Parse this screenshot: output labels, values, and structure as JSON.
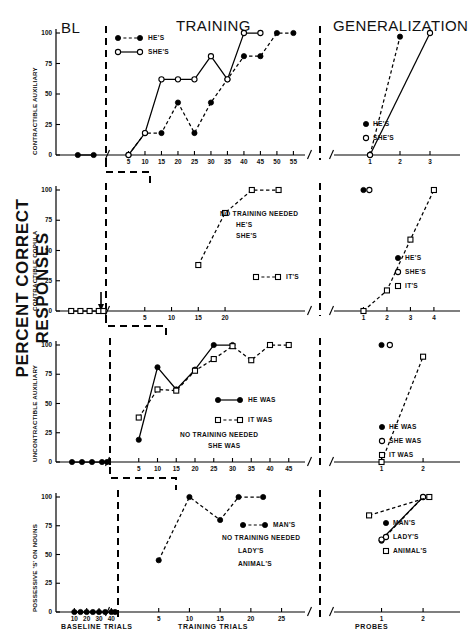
{
  "figure": {
    "y_axis_label": "PERCENT CORRECT RESPONSES",
    "section_titles": {
      "bl": "BL",
      "training": "TRAINING",
      "generalization": "GENERALIZATION"
    },
    "x_axis_names": {
      "baseline": "BASELINE  TRIALS",
      "training": "TRAINING  TRIALS",
      "probes": "PROBES"
    },
    "y_ticks": [
      "0",
      "25",
      "50",
      "75",
      "100"
    ]
  },
  "chart_data": [
    {
      "type": "line",
      "panel": 1,
      "ylabel": "CONTRACTIBLE AUXILIARY",
      "ylim": [
        0,
        100
      ],
      "ticks": {
        "baseline": [
          10,
          20
        ],
        "training": [
          5,
          10,
          15,
          20,
          25,
          30,
          35,
          40,
          45,
          50,
          55
        ],
        "probes": [
          1,
          2,
          3
        ]
      },
      "legend_top": [
        {
          "name": "HE'S",
          "marker": "filled-circle",
          "line": "dashed"
        },
        {
          "name": "SHE'S",
          "marker": "open-circle",
          "line": "solid"
        }
      ],
      "legend_gen": [
        {
          "name": "HE'S",
          "marker": "filled-circle"
        },
        {
          "name": "SHE'S",
          "marker": "open-circle"
        }
      ],
      "series": [
        {
          "name": "HE'S",
          "marker": "filled-circle",
          "line": "dashed",
          "baseline": [
            {
              "x": 10,
              "y": 0
            },
            {
              "x": 20,
              "y": 0
            }
          ],
          "training": [
            {
              "x": 5,
              "y": 0
            },
            {
              "x": 10,
              "y": 18
            },
            {
              "x": 15,
              "y": 18
            },
            {
              "x": 20,
              "y": 43
            },
            {
              "x": 25,
              "y": 18
            },
            {
              "x": 30,
              "y": 43
            },
            {
              "x": 35,
              "y": 62
            },
            {
              "x": 40,
              "y": 81
            },
            {
              "x": 45,
              "y": 81
            },
            {
              "x": 50,
              "y": 100
            },
            {
              "x": 55,
              "y": 100
            }
          ],
          "probes": [
            {
              "x": 1,
              "y": 0
            },
            {
              "x": 2,
              "y": 97
            }
          ]
        },
        {
          "name": "SHE'S",
          "marker": "open-circle",
          "line": "solid",
          "baseline": [],
          "training": [
            {
              "x": 5,
              "y": 0
            },
            {
              "x": 10,
              "y": 18
            },
            {
              "x": 15,
              "y": 62
            },
            {
              "x": 20,
              "y": 62
            },
            {
              "x": 25,
              "y": 62
            },
            {
              "x": 30,
              "y": 81
            },
            {
              "x": 35,
              "y": 62
            },
            {
              "x": 40,
              "y": 100
            },
            {
              "x": 45,
              "y": 100
            }
          ],
          "probes": [
            {
              "x": 1,
              "y": 0
            },
            {
              "x": 3,
              "y": 100
            }
          ]
        }
      ]
    },
    {
      "type": "line",
      "panel": 2,
      "ylabel": "CONTRACTIBLE COPULA",
      "ylim": [
        0,
        100
      ],
      "ticks": {
        "baseline": [
          10,
          20,
          30,
          40
        ],
        "training": [
          5,
          10,
          15,
          20
        ],
        "probes": [
          1,
          2,
          3,
          4
        ]
      },
      "annotations": [
        "NO TRAINING NEEDED",
        "HE'S",
        "SHE'S"
      ],
      "legend_inline": [
        {
          "name": "IT'S",
          "marker": "open-square",
          "line": "dashed"
        }
      ],
      "legend_gen": [
        {
          "name": "HE'S",
          "marker": "filled-circle"
        },
        {
          "name": "SHE'S",
          "marker": "open-circle"
        },
        {
          "name": "IT'S",
          "marker": "open-square"
        }
      ],
      "series": [
        {
          "name": "IT'S",
          "marker": "open-square",
          "line": "dashed",
          "baseline": [
            {
              "x": 10,
              "y": 0
            },
            {
              "x": 20,
              "y": 0
            },
            {
              "x": 30,
              "y": 0
            },
            {
              "x": 40,
              "y": 0
            },
            {
              "x": 45,
              "y": 0
            }
          ],
          "training": [
            {
              "x": 15,
              "y": 38
            },
            {
              "x": 20,
              "y": 81
            },
            {
              "x": 25,
              "y": 100
            },
            {
              "x": 30,
              "y": 100
            }
          ],
          "probes": [
            {
              "x": 1,
              "y": 0
            },
            {
              "x": 2,
              "y": 17
            },
            {
              "x": 3,
              "y": 59
            },
            {
              "x": 4,
              "y": 100
            }
          ]
        },
        {
          "name": "HE'S",
          "marker": "filled-circle",
          "line": "none",
          "baseline": [],
          "training": [],
          "probes": [
            {
              "x": 1,
              "y": 100
            }
          ]
        },
        {
          "name": "SHE'S",
          "marker": "open-circle",
          "line": "none",
          "baseline": [],
          "training": [],
          "probes": [
            {
              "x": 1.25,
              "y": 100
            }
          ]
        }
      ]
    },
    {
      "type": "line",
      "panel": 3,
      "ylabel": "UNCONTRACTIBLE AUXILIARY",
      "ylim": [
        0,
        100
      ],
      "ticks": {
        "baseline": [
          10,
          20,
          30,
          40
        ],
        "training": [
          5,
          10,
          15,
          20,
          25,
          30,
          35,
          40,
          45
        ],
        "probes": [
          1,
          2
        ]
      },
      "annotations": [
        "NO TRAINING NEEDED",
        "SHE WAS"
      ],
      "legend_inline": [
        {
          "name": "HE WAS",
          "marker": "filled-circle",
          "line": "solid"
        },
        {
          "name": "IT WAS",
          "marker": "open-square",
          "line": "dashed"
        }
      ],
      "legend_gen": [
        {
          "name": "HE WAS",
          "marker": "filled-circle"
        },
        {
          "name": "SHE WAS",
          "marker": "open-circle"
        },
        {
          "name": "IT WAS",
          "marker": "open-square"
        }
      ],
      "series": [
        {
          "name": "HE WAS",
          "marker": "filled-circle",
          "line": "solid",
          "baseline": [
            {
              "x": 10,
              "y": 0
            },
            {
              "x": 20,
              "y": 0
            },
            {
              "x": 30,
              "y": 0
            },
            {
              "x": 40,
              "y": 0
            },
            {
              "x": 45,
              "y": 0
            }
          ],
          "training": [
            {
              "x": 5,
              "y": 19
            },
            {
              "x": 10,
              "y": 81
            },
            {
              "x": 15,
              "y": 62
            },
            {
              "x": 20,
              "y": 79
            },
            {
              "x": 25,
              "y": 100
            },
            {
              "x": 30,
              "y": 100
            }
          ],
          "probes": [
            {
              "x": 1,
              "y": 100
            }
          ]
        },
        {
          "name": "IT WAS",
          "marker": "open-square",
          "line": "dashed",
          "baseline": [],
          "training": [
            {
              "x": 5,
              "y": 38
            },
            {
              "x": 10,
              "y": 62
            },
            {
              "x": 15,
              "y": 61
            },
            {
              "x": 20,
              "y": 78
            },
            {
              "x": 25,
              "y": 88
            },
            {
              "x": 30,
              "y": 99
            },
            {
              "x": 35,
              "y": 87
            },
            {
              "x": 40,
              "y": 100
            },
            {
              "x": 45,
              "y": 100
            }
          ],
          "probes": [
            {
              "x": 1,
              "y": 0
            },
            {
              "x": 2,
              "y": 90
            }
          ]
        },
        {
          "name": "SHE WAS",
          "marker": "open-circle",
          "line": "none",
          "baseline": [],
          "training": [],
          "probes": [
            {
              "x": 1.2,
              "y": 100
            }
          ]
        }
      ]
    },
    {
      "type": "line",
      "panel": 4,
      "ylabel": "POSSESSIVE 'S' ON NOUNS",
      "ylim": [
        0,
        100
      ],
      "ticks": {
        "baseline": [
          10,
          20,
          30,
          40
        ],
        "training": [
          5,
          10,
          15,
          20,
          25
        ],
        "probes": [
          1,
          2
        ]
      },
      "annotations": [
        "NO TRAINING NEEDED",
        "LADY'S",
        "ANIMAL'S"
      ],
      "legend_inline": [
        {
          "name": "MAN'S",
          "marker": "filled-circle",
          "line": "dashed"
        }
      ],
      "legend_gen": [
        {
          "name": "MAN'S",
          "marker": "filled-circle"
        },
        {
          "name": "LADY'S",
          "marker": "open-circle"
        },
        {
          "name": "ANIMAL'S",
          "marker": "open-square"
        }
      ],
      "series": [
        {
          "name": "MAN'S",
          "marker": "filled-circle",
          "line": "dashed",
          "baseline": [
            {
              "x": 10,
              "y": 0
            },
            {
              "x": 15,
              "y": 0
            },
            {
              "x": 20,
              "y": 0
            },
            {
              "x": 25,
              "y": 0
            },
            {
              "x": 30,
              "y": 0
            },
            {
              "x": 35,
              "y": 0
            },
            {
              "x": 40,
              "y": 0
            },
            {
              "x": 43,
              "y": 0
            }
          ],
          "training": [
            {
              "x": 5,
              "y": 45
            },
            {
              "x": 10,
              "y": 100
            },
            {
              "x": 15,
              "y": 80
            },
            {
              "x": 18,
              "y": 100
            },
            {
              "x": 22,
              "y": 100
            }
          ],
          "probes": [
            {
              "x": 1,
              "y": 62
            },
            {
              "x": 2,
              "y": 100
            }
          ]
        },
        {
          "name": "LADY'S",
          "marker": "open-circle",
          "line": "solid",
          "baseline": [],
          "training": [],
          "probes": [
            {
              "x": 1,
              "y": 63
            },
            {
              "x": 2,
              "y": 100
            }
          ]
        },
        {
          "name": "ANIMAL'S",
          "marker": "open-square",
          "line": "dashed",
          "baseline": [],
          "training": [],
          "probes": [
            {
              "x": 0.7,
              "y": 84
            },
            {
              "x": 2.15,
              "y": 100
            }
          ]
        }
      ]
    }
  ]
}
